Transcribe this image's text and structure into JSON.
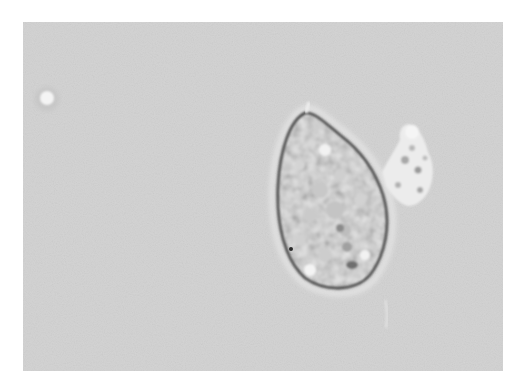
{
  "image": {
    "kind": "brightfield micrograph",
    "description": "Grayscale light-microscopy image of a single teardrop/oval shaped cell with granular cytoplasm, a small attached granular cluster on its upper right side, and a small bright round particle at the upper left of the field.",
    "colors": {
      "page_background": "#ffffff",
      "field_background": "#d4d4d4",
      "cell_membrane": "#4a4a4a",
      "cell_interior": "#e6e6e6",
      "granule_dark": "#7a7a7a",
      "bright_particle": "#f2f2f2"
    },
    "field": {
      "x": 23,
      "y": 22,
      "width": 480,
      "height": 349
    },
    "objects": [
      {
        "label": "cell",
        "shape": "teardrop",
        "center": [
          325,
          200
        ],
        "approx_width": 120,
        "approx_height": 180
      },
      {
        "label": "attached-cluster",
        "shape": "irregular",
        "center": [
          412,
          165
        ],
        "approx_width": 40,
        "approx_height": 70
      },
      {
        "label": "bright-particle",
        "shape": "circle",
        "center": [
          47,
          99
        ],
        "radius": 10
      }
    ]
  }
}
